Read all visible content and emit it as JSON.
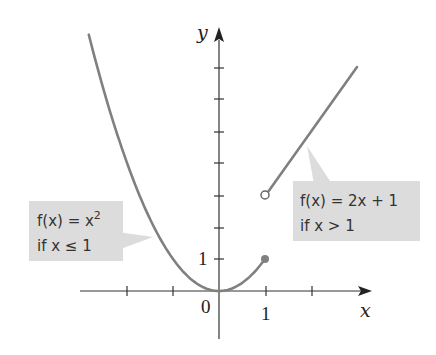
{
  "chart_data": {
    "type": "line",
    "title": "",
    "xlabel": "x",
    "ylabel": "y",
    "x_tick_labels": [
      "0",
      "1"
    ],
    "y_tick_labels": [
      "1"
    ],
    "x_ticks": [
      -2,
      -1,
      0,
      1,
      2
    ],
    "y_ticks": [
      1,
      2,
      3,
      4,
      5,
      6,
      7
    ],
    "xlim": [
      -3.1,
      3.35
    ],
    "ylim": [
      -1.5,
      8.3
    ],
    "grid": false,
    "series": [
      {
        "name": "f(x) = x^2 if x <= 1",
        "formula": "x^2",
        "domain": [
          -2.83,
          1
        ],
        "x": [
          -2.83,
          -2,
          -1,
          0,
          1
        ],
        "y": [
          8,
          4,
          1,
          0,
          1
        ],
        "endpoint": {
          "x": 1,
          "y": 1,
          "style": "closed"
        }
      },
      {
        "name": "f(x) = 2x + 1 if x > 1",
        "formula": "2x + 1",
        "domain": [
          1,
          3
        ],
        "x": [
          1,
          3
        ],
        "y": [
          3,
          7
        ],
        "endpoint": {
          "x": 1,
          "y": 3,
          "style": "open"
        }
      }
    ],
    "annotations": [
      {
        "line1": "f(x) = x",
        "superscript": "2",
        "line2": "if x ≤ 1",
        "target_series": 0
      },
      {
        "line1": "f(x) = 2x + 1",
        "line2": "if x > 1",
        "target_series": 1
      }
    ],
    "colors": {
      "curve": "#808080",
      "axis": "#333333",
      "callout_bg": "#dcdcdc"
    }
  },
  "axes": {
    "x_label": "x",
    "y_label": "y",
    "origin_label": "0",
    "x_one_label": "1",
    "y_one_label": "1"
  },
  "callouts": {
    "left": {
      "line1": "f(x) = x",
      "sup": "2",
      "line2": "if x ≤ 1"
    },
    "right": {
      "line1": "f(x) = 2x + 1",
      "line2": "if x > 1"
    }
  }
}
